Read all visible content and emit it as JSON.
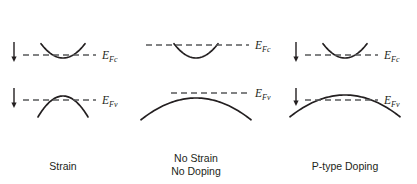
{
  "figure": {
    "width": 417,
    "height": 184,
    "background_color": "#ffffff",
    "curve_color": "#231f20",
    "fermi_line_color": "#58595b",
    "arrow_color": "#231f20"
  },
  "chart_data": {
    "type": "line",
    "xlabel": "",
    "ylabel": "Energy",
    "grid": false,
    "legend": "none",
    "note": "Three panels, each showing a conduction band parabola (opening upward) and a valence band parabola (opening downward) with dashed quasi-Fermi level lines E_Fc and E_Fv. Downward arrows mark energy-level shifts relative to the unstrained, undoped reference panel. y increases downward in pixel coordinates.",
    "panels": [
      {
        "id": "strain",
        "caption": "Strain",
        "caption_lines": [
          "Strain"
        ],
        "caption_x": 63,
        "caption_y": 170,
        "conduction_band": {
          "name": "conduction-band",
          "vertex_x": 63,
          "vertex_y": 58,
          "curvature": 0.0295,
          "half_width": 22,
          "narrow": true
        },
        "valence_band": {
          "name": "valence-band",
          "vertex_x": 63,
          "vertex_y": 96,
          "curvature": 0.0335,
          "half_width": 25,
          "narrow": true
        },
        "fermi_levels": [
          {
            "name": "E_Fc",
            "label_main": "E",
            "label_sub": "Fc",
            "y": 55,
            "x_start": 23,
            "x_end": 96,
            "label_x": 102,
            "label_y": 59
          },
          {
            "name": "E_Fv",
            "label_main": "E",
            "label_sub": "Fv",
            "y": 100,
            "x_start": 23,
            "x_end": 96,
            "label_x": 102,
            "label_y": 104
          }
        ],
        "shift_arrows": [
          {
            "name": "conduction-shift-arrow",
            "x": 14,
            "y_top": 42,
            "y_bottom": 62,
            "direction": "down"
          },
          {
            "name": "valence-shift-arrow",
            "x": 14,
            "y_top": 88,
            "y_bottom": 108,
            "direction": "down"
          }
        ]
      },
      {
        "id": "no-strain-no-doping",
        "caption": "No Strain No Doping",
        "caption_lines": [
          "No Strain",
          "No Doping"
        ],
        "caption_x": 196,
        "caption_y": 162,
        "conduction_band": {
          "name": "conduction-band",
          "vertex_x": 196,
          "vertex_y": 58,
          "curvature": 0.0295,
          "half_width": 22,
          "narrow": true
        },
        "valence_band": {
          "name": "valence-band",
          "vertex_x": 196,
          "vertex_y": 98,
          "curvature": 0.0072,
          "half_width": 55,
          "narrow": false
        },
        "fermi_levels": [
          {
            "name": "E_Fc",
            "label_main": "E",
            "label_sub": "Fc",
            "y": 45,
            "x_start": 146,
            "x_end": 249,
            "label_x": 255,
            "label_y": 49
          },
          {
            "name": "E_Fv",
            "label_main": "E",
            "label_sub": "Fv",
            "y": 93,
            "x_start": 171,
            "x_end": 249,
            "label_x": 255,
            "label_y": 97
          }
        ],
        "shift_arrows": []
      },
      {
        "id": "p-type-doping",
        "caption": "P-type Doping",
        "caption_lines": [
          "P-type Doping"
        ],
        "caption_x": 345,
        "caption_y": 170,
        "conduction_band": {
          "name": "conduction-band",
          "vertex_x": 345,
          "vertex_y": 58,
          "curvature": 0.0295,
          "half_width": 22,
          "narrow": true
        },
        "valence_band": {
          "name": "valence-band",
          "vertex_x": 345,
          "vertex_y": 95,
          "curvature": 0.0072,
          "half_width": 55,
          "narrow": false
        },
        "fermi_levels": [
          {
            "name": "E_Fc",
            "label_main": "E",
            "label_sub": "Fc",
            "y": 55,
            "x_start": 305,
            "x_end": 378,
            "label_x": 384,
            "label_y": 59
          },
          {
            "name": "E_Fv",
            "label_main": "E",
            "label_sub": "Fv",
            "y": 100,
            "x_start": 305,
            "x_end": 378,
            "label_x": 384,
            "label_y": 104
          }
        ],
        "shift_arrows": [
          {
            "name": "conduction-shift-arrow",
            "x": 296,
            "y_top": 42,
            "y_bottom": 62,
            "direction": "down"
          },
          {
            "name": "valence-shift-arrow",
            "x": 296,
            "y_top": 88,
            "y_bottom": 106,
            "direction": "down"
          }
        ]
      }
    ]
  }
}
